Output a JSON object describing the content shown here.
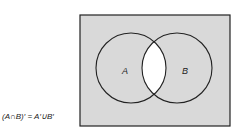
{
  "diagram": {
    "type": "venn",
    "sets": [
      {
        "label": "A"
      },
      {
        "label": "B"
      }
    ],
    "shaded_region": "complement of A∩B",
    "caption": "(A∩B)′ = A′∪B′",
    "colors": {
      "shade": "#d9d9d9",
      "unshaded": "#ffffff",
      "stroke": "#222222"
    }
  }
}
